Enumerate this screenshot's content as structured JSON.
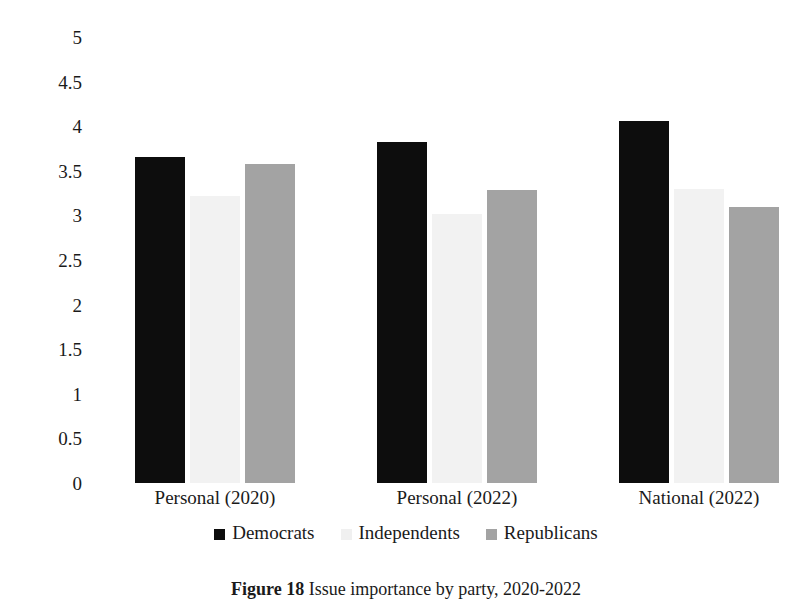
{
  "chart_data": {
    "type": "bar",
    "title": "",
    "xlabel": "",
    "ylabel": "Average Issue Importance",
    "ylim": [
      0,
      5
    ],
    "ytick_step": 0.5,
    "ytick_labels": [
      "5",
      "4.5",
      "4",
      "3.5",
      "3",
      "2.5",
      "2",
      "1.5",
      "1",
      "0.5",
      "0"
    ],
    "ytick_values": [
      5,
      4.5,
      4,
      3.5,
      3,
      2.5,
      2,
      1.5,
      1,
      0.5,
      0
    ],
    "grid": false,
    "legend_position": "bottom",
    "categories": [
      "Personal (2020)",
      "Personal (2022)",
      "National (2022)"
    ],
    "series": [
      {
        "name": "Democrats",
        "color": "#0d0d0d",
        "values": [
          3.65,
          3.82,
          4.06
        ]
      },
      {
        "name": "Independents",
        "color": "#f0f0f0",
        "values": [
          3.22,
          3.02,
          3.3
        ]
      },
      {
        "name": "Republicans",
        "color": "#a3a3a3",
        "values": [
          3.58,
          3.28,
          3.09
        ]
      }
    ]
  },
  "caption": {
    "label": "Figure 18",
    "text": "Issue importance by party, 2020-2022"
  }
}
